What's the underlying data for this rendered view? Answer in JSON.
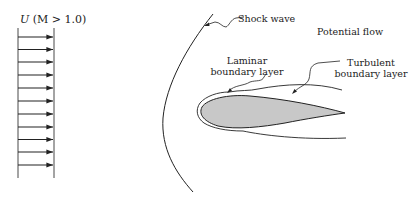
{
  "diagram": {
    "freestream_label": "U (M > 1.0)",
    "freestream_label_parts": {
      "symbol": "U",
      "condition": "(M > 1.0)"
    },
    "labels": {
      "shock_wave": "Shock wave",
      "potential_flow": "Potential flow",
      "laminar_line1": "Laminar",
      "laminar_line2": "boundary layer",
      "turbulent_line1": "Turbulent",
      "turbulent_line2": "boundary layer"
    },
    "arrow_count": 11,
    "colors": {
      "line": "#222222",
      "airfoil_fill": "#c8c8c8",
      "background": "#ffffff"
    }
  }
}
